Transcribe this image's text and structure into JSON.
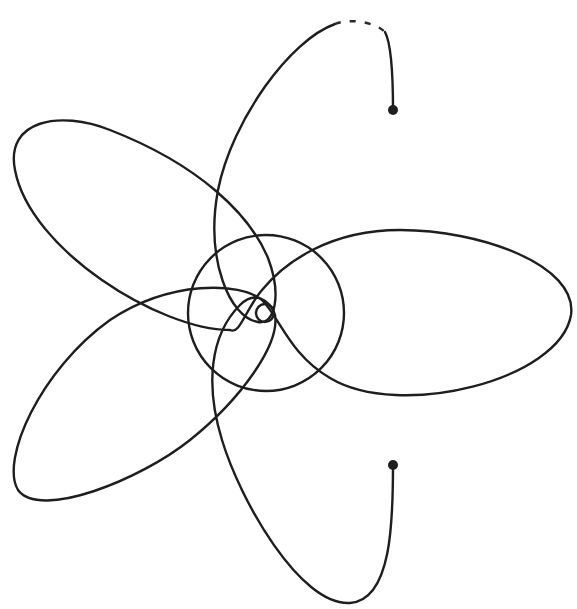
{
  "diagram": {
    "colors": {
      "background": "#ffffff",
      "line": "#1e1e1e"
    },
    "center": {
      "x": 265,
      "y": 313
    },
    "central_circle": {
      "cx": 266,
      "cy": 313,
      "r": 78
    },
    "inner_circle": {
      "cx": 265,
      "cy": 313,
      "r": 9
    },
    "start_point": {
      "x": 393,
      "y": 465
    },
    "end_point": {
      "x": 393,
      "y": 110
    },
    "trajectory_path": "M393,465 C393,520 392,600 350,603 C300,606 240,500 222,440 C205,385 210,335 240,305 C255,290 270,300 275,315 C280,345 240,400 190,440 C140,480 40,520 18,490 C0,460 40,370 110,320 C170,280 240,282 262,300 C280,318 290,355 330,378 C400,420 560,380 571,315 C578,265 480,230 400,230 C330,230 285,262 262,290 C245,310 240,335 230,330 C160,330 30,250 15,170 C5,120 60,110 110,130 C200,165 250,215 268,258 C282,295 275,325 258,322 C230,318 205,260 218,190 C232,120 290,40 335,24",
    "top_dashed_segment": "M335,24 C350,18 375,22 385,32",
    "top_tail": "M385,32 C392,45 393,80 393,110"
  }
}
